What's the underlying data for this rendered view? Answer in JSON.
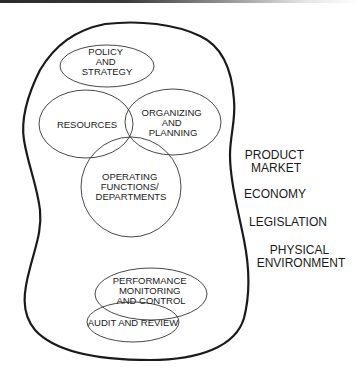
{
  "diagram": {
    "organization_boundary": "organization",
    "internal_elements": [
      {
        "id": "policy",
        "lines": [
          "POLICY",
          "AND",
          "STRATEGY"
        ]
      },
      {
        "id": "resources",
        "lines": [
          "RESOURCES"
        ]
      },
      {
        "id": "organizing",
        "lines": [
          "ORGANIZING",
          "AND",
          "PLANNING"
        ]
      },
      {
        "id": "operating",
        "lines": [
          "OPERATING",
          "FUNCTIONS/",
          "DEPARTMENTS"
        ]
      },
      {
        "id": "performance",
        "lines": [
          "PERFORMANCE",
          "MONITORING",
          "AND CONTROL"
        ]
      },
      {
        "id": "audit",
        "lines": [
          "AUDIT AND REVIEW"
        ]
      }
    ],
    "external_factors": [
      {
        "id": "product-market",
        "lines": [
          "PRODUCT",
          "MARKET"
        ]
      },
      {
        "id": "economy",
        "lines": [
          "ECONOMY"
        ]
      },
      {
        "id": "legislation",
        "lines": [
          "LEGISLATION"
        ]
      },
      {
        "id": "physical-environment",
        "lines": [
          "PHYSICAL",
          "ENVIRONMENT"
        ]
      }
    ]
  },
  "colors": {
    "stroke": "#1a1a1a",
    "text": "#1a1a1a",
    "background": "#ffffff"
  }
}
